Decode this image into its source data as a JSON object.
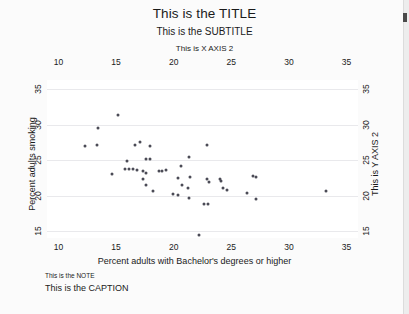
{
  "chart_data": {
    "type": "scatter",
    "title": "This is the TITLE",
    "subtitle": "This is the SUBTITLE",
    "xlabel": "Percent adults with Bachelor's degrees or higher",
    "xlabel_top": "This is X AXIS 2",
    "ylabel": "Percent adults smoking",
    "ylabel_right": "This is Y AXIS 2",
    "note": "This is the NOTE",
    "caption": "This is the CAPTION",
    "xlim": [
      9.0,
      36.0
    ],
    "ylim": [
      14.0,
      36.3
    ],
    "xticks": [
      10,
      15,
      20,
      25,
      30,
      35
    ],
    "yticks": [
      15,
      20,
      25,
      30,
      35
    ],
    "xticks_top": [
      10,
      15,
      20,
      25,
      30,
      35
    ],
    "yticks_right": [
      15,
      20,
      25,
      30,
      35
    ],
    "grid": "horizontal",
    "legend": "none",
    "marker_color": "#4b4b56",
    "points": [
      {
        "x": 15.2,
        "y": 31.4
      },
      {
        "x": 13.4,
        "y": 29.6
      },
      {
        "x": 12.3,
        "y": 27.0
      },
      {
        "x": 13.3,
        "y": 27.1
      },
      {
        "x": 16.6,
        "y": 27.1
      },
      {
        "x": 17.1,
        "y": 27.5
      },
      {
        "x": 17.9,
        "y": 27.0
      },
      {
        "x": 22.9,
        "y": 27.1
      },
      {
        "x": 15.9,
        "y": 24.9
      },
      {
        "x": 17.6,
        "y": 25.2
      },
      {
        "x": 17.9,
        "y": 25.1
      },
      {
        "x": 21.3,
        "y": 25.4
      },
      {
        "x": 20.6,
        "y": 24.2
      },
      {
        "x": 14.6,
        "y": 23.0
      },
      {
        "x": 15.8,
        "y": 23.7
      },
      {
        "x": 16.1,
        "y": 23.7
      },
      {
        "x": 16.5,
        "y": 23.7
      },
      {
        "x": 16.8,
        "y": 23.6
      },
      {
        "x": 17.3,
        "y": 23.5
      },
      {
        "x": 17.6,
        "y": 23.2
      },
      {
        "x": 18.7,
        "y": 23.5
      },
      {
        "x": 19.0,
        "y": 23.4
      },
      {
        "x": 19.3,
        "y": 23.6
      },
      {
        "x": 17.3,
        "y": 22.4
      },
      {
        "x": 20.4,
        "y": 22.5
      },
      {
        "x": 21.4,
        "y": 22.6
      },
      {
        "x": 22.9,
        "y": 22.4
      },
      {
        "x": 23.1,
        "y": 21.9
      },
      {
        "x": 24.0,
        "y": 22.4
      },
      {
        "x": 24.1,
        "y": 22.1
      },
      {
        "x": 26.9,
        "y": 22.7
      },
      {
        "x": 27.1,
        "y": 22.6
      },
      {
        "x": 17.6,
        "y": 21.5
      },
      {
        "x": 20.7,
        "y": 21.5
      },
      {
        "x": 21.2,
        "y": 21.0
      },
      {
        "x": 24.3,
        "y": 21.0
      },
      {
        "x": 24.6,
        "y": 20.8
      },
      {
        "x": 18.2,
        "y": 20.6
      },
      {
        "x": 19.9,
        "y": 20.2
      },
      {
        "x": 20.4,
        "y": 20.1
      },
      {
        "x": 26.4,
        "y": 20.4
      },
      {
        "x": 33.2,
        "y": 20.7
      },
      {
        "x": 21.3,
        "y": 19.6
      },
      {
        "x": 27.1,
        "y": 19.5
      },
      {
        "x": 22.6,
        "y": 18.8
      },
      {
        "x": 23.0,
        "y": 18.8
      },
      {
        "x": 22.2,
        "y": 14.4
      }
    ]
  }
}
